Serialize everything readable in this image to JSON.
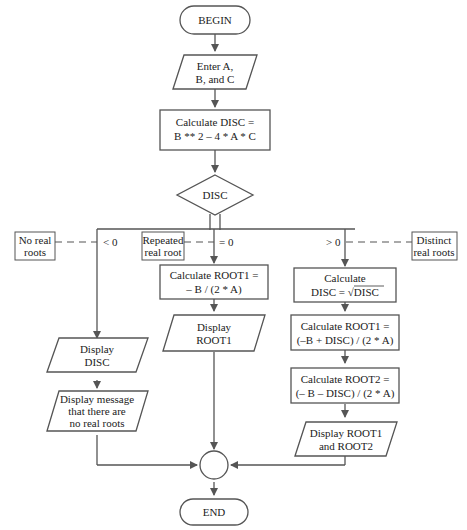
{
  "diagram": {
    "type": "flowchart",
    "colors": {
      "line": "#555555",
      "text": "#222222",
      "background": "#ffffff"
    },
    "nodes": {
      "begin": {
        "shape": "terminal",
        "lines": [
          "BEGIN"
        ]
      },
      "input": {
        "shape": "parallelogram",
        "lines": [
          "Enter A,",
          "B, and C"
        ]
      },
      "calc_disc": {
        "shape": "process",
        "lines": [
          "Calculate DISC =",
          "B ** 2 – 4 * A * C"
        ]
      },
      "decision": {
        "shape": "diamond",
        "lines": [
          "DISC"
        ]
      },
      "calc_root1_repeated": {
        "shape": "process",
        "lines": [
          "Calculate ROOT1 =",
          "– B / (2 * A)"
        ]
      },
      "display_root1": {
        "shape": "parallelogram",
        "lines": [
          "Display",
          "ROOT1"
        ]
      },
      "calc_sqrt": {
        "shape": "process",
        "lines": [
          "Calculate",
          "DISC = √DISC"
        ]
      },
      "calc_root1": {
        "shape": "process",
        "lines": [
          "Calculate ROOT1 =",
          "(–B + DISC) / (2 * A)"
        ]
      },
      "calc_root2": {
        "shape": "process",
        "lines": [
          "Calculate ROOT2 =",
          "(– B – DISC) / (2 * A)"
        ]
      },
      "display_roots": {
        "shape": "parallelogram",
        "lines": [
          "Display ROOT1",
          "and ROOT2"
        ]
      },
      "display_disc": {
        "shape": "parallelogram",
        "lines": [
          "Display",
          "DISC"
        ]
      },
      "display_msg": {
        "shape": "parallelogram",
        "lines": [
          "Display message",
          "that there are",
          "no real roots"
        ]
      },
      "connector": {
        "shape": "circle",
        "lines": []
      },
      "end": {
        "shape": "terminal",
        "lines": [
          "END"
        ]
      }
    },
    "branch_labels": {
      "negative": "< 0",
      "zero": "= 0",
      "positive": "> 0"
    },
    "annotations": {
      "no_real": [
        "No real",
        "roots"
      ],
      "repeated": [
        "Repeated",
        "real root"
      ],
      "distinct": [
        "Distinct",
        "real roots"
      ]
    }
  }
}
